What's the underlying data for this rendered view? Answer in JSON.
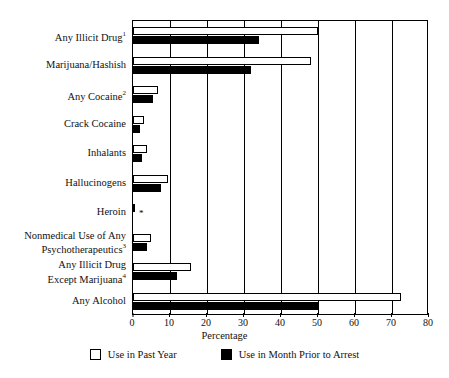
{
  "chart_data": {
    "type": "bar",
    "orientation": "horizontal",
    "title": "",
    "xlabel": "Percentage",
    "ylabel": "",
    "xlim": [
      0,
      80
    ],
    "xticks": [
      0,
      10,
      20,
      30,
      40,
      50,
      60,
      70,
      80
    ],
    "grid": true,
    "grid_axis": "x",
    "legend_position": "bottom",
    "categories": [
      "Any Illicit Drug¹",
      "Marijuana/Hashish",
      "Any Cocaine²",
      "Crack Cocaine",
      "Inhalants",
      "Hallucinogens",
      "Heroin",
      "Nonmedical Use of Any\nPsychotherapeutics³",
      "Any Illicit Drug\nExcept Marijuana⁴",
      "Any Alcohol"
    ],
    "series": [
      {
        "name": "Use in Past Year",
        "color": "#ffffff",
        "edge_color": "#000000",
        "values": [
          50.0,
          48.0,
          6.8,
          3.0,
          3.8,
          9.5,
          0.5,
          4.9,
          15.7,
          72.5
        ]
      },
      {
        "name": "Use in Month Prior to Arrest",
        "color": "#000000",
        "edge_color": "#000000",
        "values": [
          34.0,
          32.0,
          5.4,
          2.0,
          2.4,
          7.5,
          0.0,
          3.8,
          12.0,
          50.0
        ]
      }
    ],
    "annotations": [
      {
        "category": "Heroin",
        "series": "Use in Month Prior to Arrest",
        "marker": "*",
        "meaning": "low-precision estimate"
      }
    ]
  },
  "legend": {
    "items": [
      {
        "label": "Use in Past Year",
        "swatch": "open-square-icon"
      },
      {
        "label": "Use in Month Prior to Arrest",
        "swatch": "filled-square-icon"
      }
    ]
  },
  "axis": {
    "x_title": "Percentage",
    "x_tick_labels": [
      "0",
      "10",
      "20",
      "30",
      "40",
      "50",
      "60",
      "70",
      "80"
    ]
  },
  "colors": {
    "past_year_fill": "#ffffff",
    "month_prior_fill": "#000000",
    "axis": "#000000",
    "text": "#111111",
    "background": "#ffffff"
  }
}
